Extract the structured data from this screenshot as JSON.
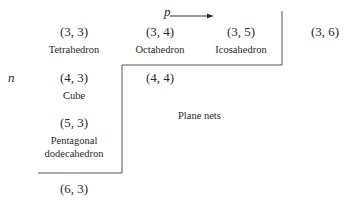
{
  "axes": {
    "p_label": "p",
    "n_label": "n",
    "arrow": "p-direction-arrow"
  },
  "cells": [
    {
      "pair": "(3, 3)",
      "name": "Tetrahedron"
    },
    {
      "pair": "(3, 4)",
      "name": "Octahedron"
    },
    {
      "pair": "(3, 5)",
      "name": "Icosahedron"
    },
    {
      "pair": "(3, 6)",
      "name": ""
    },
    {
      "pair": "(4, 3)",
      "name": "Cube"
    },
    {
      "pair": "(4, 4)",
      "name": ""
    },
    {
      "pair": "(5, 3)",
      "name_line1": "Pentagonal",
      "name_line2": "dodecahedron"
    },
    {
      "pair": "(6, 3)",
      "name": ""
    }
  ],
  "region_label": "Plane nets",
  "colors": {
    "line": "#555555",
    "text": "#2a2a2a",
    "background": "#ffffff"
  }
}
